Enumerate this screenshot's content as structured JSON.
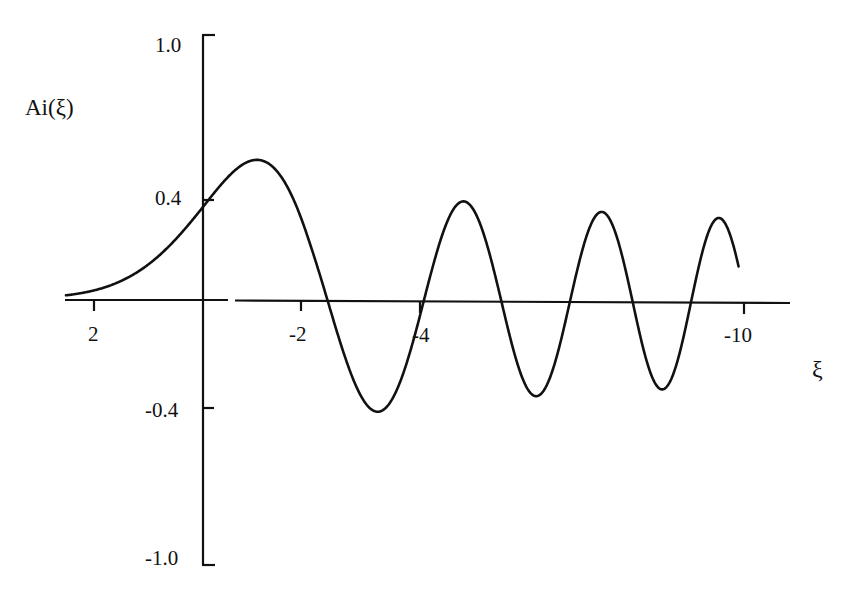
{
  "chart_data": {
    "type": "line",
    "title": "",
    "xlabel": "ξ",
    "ylabel": "Ai(ξ)",
    "x_direction": "reversed (positive ξ on left, negative ξ on right)",
    "xlim": [
      2.5,
      -10.9
    ],
    "ylim": [
      -1.0,
      1.0
    ],
    "x_ticks": [
      2,
      0,
      -2,
      -4,
      -10
    ],
    "x_tick_labels": [
      "2",
      "-2",
      "-4",
      "-10"
    ],
    "y_ticks": [
      1.0,
      0.4,
      -0.4,
      -1.0
    ],
    "y_tick_labels": [
      "1.0",
      "0.4",
      "-0.4",
      "-1.0"
    ],
    "grid": false,
    "legend": null,
    "series": [
      {
        "name": "Ai(ξ)",
        "function": "Airy function Ai",
        "x_range": [
          2.5,
          -9.9
        ],
        "key_points": [
          {
            "x": 2.5,
            "y": 0.0157
          },
          {
            "x": 2.0,
            "y": 0.0349
          },
          {
            "x": 1.0,
            "y": 0.1353
          },
          {
            "x": 0.0,
            "y": 0.355
          },
          {
            "x": -1.02,
            "y": 0.5357
          },
          {
            "x": -2.34,
            "y": 0.0
          },
          {
            "x": -3.25,
            "y": -0.419
          },
          {
            "x": -4.09,
            "y": 0.0
          },
          {
            "x": -4.82,
            "y": 0.3804
          },
          {
            "x": -5.52,
            "y": 0.0
          },
          {
            "x": -6.16,
            "y": -0.3579
          },
          {
            "x": -6.79,
            "y": 0.0
          },
          {
            "x": -7.37,
            "y": 0.3417
          },
          {
            "x": -7.94,
            "y": 0.0
          },
          {
            "x": -8.49,
            "y": -0.3291
          },
          {
            "x": -9.02,
            "y": 0.0
          },
          {
            "x": -9.54,
            "y": 0.3187
          },
          {
            "x": -9.9,
            "y": 0.05
          }
        ]
      }
    ]
  },
  "labels": {
    "ylabel": "Ai(ξ)",
    "xlabel": "ξ",
    "ytick_top": "1.0",
    "ytick_04": "0.4",
    "ytick_m04": "-0.4",
    "ytick_bottom": "-1.0",
    "xtick_2": "2",
    "xtick_m2": "-2",
    "xtick_m4": "-4",
    "xtick_m10": "-10"
  },
  "style": {
    "line_color": "#111111",
    "background": "#ffffff"
  }
}
